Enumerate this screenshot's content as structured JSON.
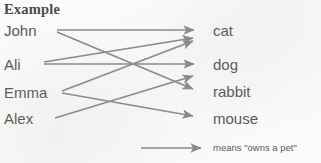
{
  "diagram": {
    "title": "Example",
    "arrow_color": "#8b8b8b",
    "text_color": "#595959",
    "background_color": "#fbfbfa",
    "left_column": {
      "name": "people",
      "nodes": [
        {
          "id": "john",
          "label": "John",
          "x": 4,
          "y": 30
        },
        {
          "id": "ali",
          "label": "Ali",
          "x": 4,
          "y": 64
        },
        {
          "id": "emma",
          "label": "Emma",
          "x": 4,
          "y": 92
        },
        {
          "id": "alex",
          "label": "Alex",
          "x": 4,
          "y": 118
        }
      ]
    },
    "right_column": {
      "name": "pets",
      "nodes": [
        {
          "id": "cat",
          "label": "cat",
          "x": 213,
          "y": 30
        },
        {
          "id": "dog",
          "label": "dog",
          "x": 213,
          "y": 64
        },
        {
          "id": "rabbit",
          "label": "rabbit",
          "x": 213,
          "y": 91
        },
        {
          "id": "mouse",
          "label": "mouse",
          "x": 213,
          "y": 118
        }
      ]
    },
    "edges": [
      {
        "id": "john-cat",
        "from": "John",
        "to": "cat",
        "x1": 57,
        "y1": 30,
        "x2": 196,
        "y2": 30
      },
      {
        "id": "john-rabbit",
        "from": "John",
        "to": "rabbit",
        "x1": 57,
        "y1": 32,
        "x2": 196,
        "y2": 90
      },
      {
        "id": "ali-dog",
        "from": "Ali",
        "to": "dog",
        "x1": 44,
        "y1": 64,
        "x2": 196,
        "y2": 64
      },
      {
        "id": "ali-cat",
        "from": "Ali",
        "to": "cat",
        "x1": 44,
        "y1": 62,
        "x2": 196,
        "y2": 38
      },
      {
        "id": "emma-cat",
        "from": "Emma",
        "to": "cat",
        "x1": 62,
        "y1": 91,
        "x2": 196,
        "y2": 41
      },
      {
        "id": "emma-mouse",
        "from": "Emma",
        "to": "mouse",
        "x1": 62,
        "y1": 93,
        "x2": 196,
        "y2": 117
      },
      {
        "id": "alex-rabbit",
        "from": "Alex",
        "to": "rabbit",
        "x1": 55,
        "y1": 118,
        "x2": 196,
        "y2": 76
      }
    ],
    "legend": {
      "arrow_name": "legend-arrow",
      "text": "means \"owns a pet\"",
      "arrow_x1": 141,
      "arrow_x2": 203,
      "arrow_y": 148
    }
  }
}
